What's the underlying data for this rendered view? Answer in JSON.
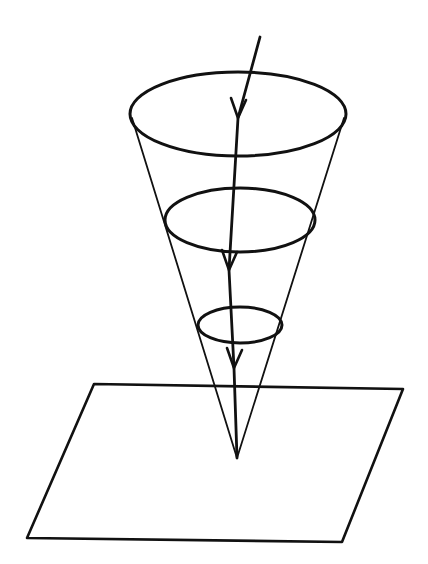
{
  "diagram": {
    "description": "Hand-drawn cone with apex touching a plane; a downward-pointing line with three arrowheads runs through three cross-section ellipses",
    "colors": {
      "ink": "#111111",
      "background": "#ffffff"
    },
    "cone": {
      "apex": [
        237,
        458
      ],
      "ellipses": [
        {
          "name": "top",
          "cx": 238,
          "cy": 114,
          "rx": 108,
          "ry": 42
        },
        {
          "name": "middle",
          "cx": 240,
          "cy": 220,
          "rx": 75,
          "ry": 32
        },
        {
          "name": "bottom",
          "cx": 240,
          "cy": 325,
          "rx": 42,
          "ry": 18
        }
      ]
    },
    "plane": {
      "corners": [
        [
          94,
          384
        ],
        [
          403,
          389
        ],
        [
          342,
          542
        ],
        [
          27,
          538
        ]
      ]
    },
    "ray": {
      "start": [
        260,
        37
      ],
      "end": [
        237,
        458
      ],
      "arrowheads": [
        [
          238,
          118
        ],
        [
          229,
          270
        ],
        [
          234,
          368
        ]
      ]
    }
  }
}
